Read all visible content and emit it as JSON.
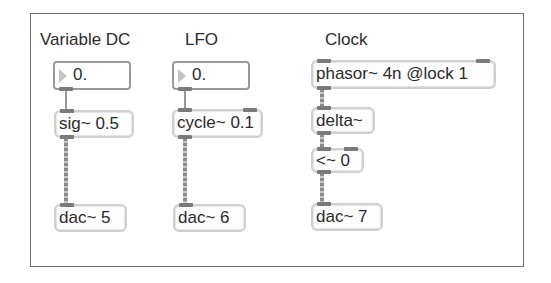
{
  "patcher": {
    "columns": [
      {
        "label": "Variable DC",
        "number_box": {
          "value": "0."
        },
        "objects": [
          {
            "text": "sig~ 0.5"
          },
          {
            "text": "dac~ 5"
          }
        ]
      },
      {
        "label": "LFO",
        "number_box": {
          "value": "0."
        },
        "objects": [
          {
            "text": "cycle~ 0.1"
          },
          {
            "text": "dac~ 6"
          }
        ]
      },
      {
        "label": "Clock",
        "objects": [
          {
            "text": "phasor~ 4n @lock 1"
          },
          {
            "text": "delta~"
          },
          {
            "text": "<~ 0"
          },
          {
            "text": "dac~ 7"
          }
        ]
      }
    ]
  },
  "colors": {
    "border": "#707070",
    "object_border": "#cfcfcf",
    "number_border": "#9a9a9a",
    "inlet": "#7a7a7a",
    "text": "#2b2b2b"
  }
}
